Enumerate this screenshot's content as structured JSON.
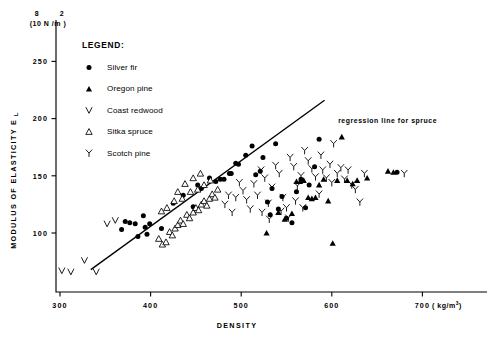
{
  "figure": {
    "axis_unit_y_sup_left": "8",
    "axis_unit_y_sup_right": "2",
    "axis_unit_y": "(10 N /m )",
    "y_axis_title": "MODULUS OF ELASTICITY E",
    "y_axis_title_sub": "L",
    "x_axis_title": "DENSITY",
    "x_unit_base": "( kg/m",
    "x_unit_sup": "3",
    "x_unit_close": ")",
    "annotation": "regression line for spruce"
  },
  "legend": {
    "title": "LEGEND:",
    "items": [
      {
        "label": "Silver fir",
        "marker": "filled-circle-icon"
      },
      {
        "label": "Oregon pine",
        "marker": "filled-triangle-icon"
      },
      {
        "label": "Coast redwood",
        "marker": "vee-icon"
      },
      {
        "label": "Sitka spruce",
        "marker": "open-triangle-icon"
      },
      {
        "label": "Scotch pine",
        "marker": "wye-icon"
      }
    ]
  },
  "chart_data": {
    "type": "scatter",
    "title": "",
    "xlabel": "DENSITY",
    "ylabel": "MODULUS OF ELASTICITY E_L",
    "x_unit": "kg/m^3",
    "y_unit": "10^8 N/m^2",
    "xlim": [
      285,
      730
    ],
    "ylim": [
      60,
      268
    ],
    "xticks": [
      300,
      400,
      500,
      600,
      700
    ],
    "yticks": [
      100,
      150,
      200,
      250
    ],
    "grid": false,
    "legend_position": "upper-left-inside",
    "annotations": [
      {
        "text": "regression line for spruce",
        "x": 607,
        "y": 196
      }
    ],
    "regression_line": {
      "label": "regression line for spruce",
      "x": [
        334,
        592
      ],
      "y": [
        68,
        216
      ]
    },
    "series": [
      {
        "name": "Silver fir",
        "marker": "filled-circle",
        "points": [
          [
            368,
            103
          ],
          [
            372,
            110
          ],
          [
            377,
            109
          ],
          [
            383,
            108
          ],
          [
            386,
            97
          ],
          [
            392,
            115
          ],
          [
            394,
            105
          ],
          [
            396,
            99
          ],
          [
            399,
            108
          ],
          [
            412,
            104
          ],
          [
            425,
            126
          ],
          [
            436,
            133
          ],
          [
            447,
            123
          ],
          [
            452,
            142
          ],
          [
            456,
            139
          ],
          [
            465,
            148
          ],
          [
            472,
            145
          ],
          [
            477,
            147
          ],
          [
            481,
            147
          ],
          [
            487,
            152
          ],
          [
            489,
            152
          ],
          [
            494,
            161
          ],
          [
            497,
            160
          ],
          [
            505,
            168
          ],
          [
            512,
            176
          ],
          [
            516,
            151
          ],
          [
            521,
            154
          ],
          [
            524,
            166
          ],
          [
            529,
            127
          ],
          [
            532,
            116
          ],
          [
            534,
            139
          ],
          [
            538,
            178
          ],
          [
            541,
            121
          ],
          [
            545,
            132
          ],
          [
            550,
            113
          ],
          [
            556,
            109
          ],
          [
            561,
            136
          ],
          [
            566,
            147
          ],
          [
            571,
            122
          ],
          [
            575,
            142
          ],
          [
            581,
            158
          ],
          [
            586,
            182
          ],
          [
            672,
            153
          ]
        ]
      },
      {
        "name": "Oregon pine",
        "marker": "filled-triangle",
        "points": [
          [
            528,
            100
          ],
          [
            541,
            118
          ],
          [
            548,
            112
          ],
          [
            556,
            117
          ],
          [
            561,
            145
          ],
          [
            565,
            145
          ],
          [
            569,
            146
          ],
          [
            574,
            131
          ],
          [
            578,
            130
          ],
          [
            582,
            131
          ],
          [
            586,
            142
          ],
          [
            591,
            147
          ],
          [
            596,
            128
          ],
          [
            601,
            91
          ],
          [
            606,
            146
          ],
          [
            611,
            184
          ],
          [
            617,
            146
          ],
          [
            623,
            143
          ],
          [
            628,
            146
          ],
          [
            639,
            148
          ],
          [
            662,
            154
          ],
          [
            668,
            153
          ]
        ]
      },
      {
        "name": "Coast redwood",
        "marker": "vee",
        "points": [
          [
            302,
            67
          ],
          [
            312,
            66
          ],
          [
            327,
            76
          ],
          [
            340,
            66
          ],
          [
            352,
            108
          ],
          [
            361,
            111
          ]
        ]
      },
      {
        "name": "Sitka spruce",
        "marker": "open-triangle",
        "points": [
          [
            409,
            95
          ],
          [
            413,
            90
          ],
          [
            417,
            92
          ],
          [
            421,
            101
          ],
          [
            424,
            98
          ],
          [
            427,
            104
          ],
          [
            430,
            107
          ],
          [
            433,
            111
          ],
          [
            436,
            108
          ],
          [
            440,
            116
          ],
          [
            443,
            113
          ],
          [
            447,
            118
          ],
          [
            450,
            122
          ],
          [
            453,
            120
          ],
          [
            456,
            125
          ],
          [
            459,
            128
          ],
          [
            462,
            124
          ],
          [
            465,
            130
          ],
          [
            468,
            134
          ],
          [
            471,
            131
          ],
          [
            474,
            138
          ],
          [
            412,
            119
          ],
          [
            418,
            122
          ],
          [
            426,
            128
          ],
          [
            435,
            130
          ],
          [
            444,
            136
          ],
          [
            452,
            138
          ],
          [
            459,
            142
          ],
          [
            466,
            146
          ],
          [
            438,
            143
          ],
          [
            447,
            148
          ],
          [
            455,
            152
          ],
          [
            430,
            136
          ]
        ]
      },
      {
        "name": "Scotch pine",
        "marker": "wye",
        "points": [
          [
            482,
            125
          ],
          [
            486,
            133
          ],
          [
            490,
            118
          ],
          [
            494,
            131
          ],
          [
            498,
            144
          ],
          [
            502,
            137
          ],
          [
            506,
            129
          ],
          [
            510,
            121
          ],
          [
            514,
            143
          ],
          [
            518,
            133
          ],
          [
            522,
            155
          ],
          [
            526,
            148
          ],
          [
            530,
            126
          ],
          [
            534,
            140
          ],
          [
            538,
            159
          ],
          [
            542,
            152
          ],
          [
            546,
            131
          ],
          [
            550,
            122
          ],
          [
            554,
            166
          ],
          [
            558,
            158
          ],
          [
            562,
            141
          ],
          [
            566,
            150
          ],
          [
            570,
            172
          ],
          [
            574,
            163
          ],
          [
            578,
            156
          ],
          [
            582,
            149
          ],
          [
            586,
            134
          ],
          [
            590,
            155
          ],
          [
            594,
            148
          ],
          [
            598,
            160
          ],
          [
            602,
            178
          ],
          [
            606,
            152
          ],
          [
            610,
            157
          ],
          [
            614,
            147
          ],
          [
            618,
            155
          ],
          [
            622,
            142
          ],
          [
            626,
            138
          ],
          [
            631,
            127
          ],
          [
            636,
            152
          ],
          [
            680,
            152
          ],
          [
            523,
            118
          ],
          [
            531,
            112
          ],
          [
            544,
            119
          ],
          [
            552,
            113
          ],
          [
            560,
            128
          ],
          [
            568,
            122
          ],
          [
            588,
            168
          ],
          [
            600,
            144
          ]
        ]
      }
    ]
  }
}
